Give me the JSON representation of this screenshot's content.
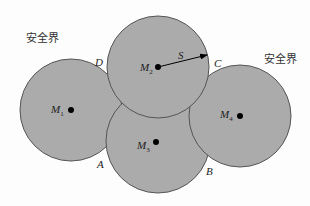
{
  "diagram": {
    "zone_labels": {
      "left": "安全界",
      "right": "安全界"
    },
    "circles": [
      {
        "id": "M1",
        "name": "M",
        "sub": "1",
        "cx": 71,
        "cy": 110,
        "r": 51
      },
      {
        "id": "M3",
        "name": "M",
        "sub": "3",
        "cx": 158,
        "cy": 141,
        "r": 52
      },
      {
        "id": "M4",
        "name": "M",
        "sub": "4",
        "cx": 240,
        "cy": 116,
        "r": 51
      },
      {
        "id": "M2",
        "name": "M",
        "sub": "2",
        "cx": 158,
        "cy": 67,
        "r": 51
      }
    ],
    "points": {
      "A": "A",
      "B": "B",
      "C": "C",
      "D": "D"
    },
    "radius_label": "S",
    "colors": {
      "fill": "#ababab",
      "stroke": "#555555",
      "dot": "#000000",
      "background": "#fdfdfd"
    }
  }
}
